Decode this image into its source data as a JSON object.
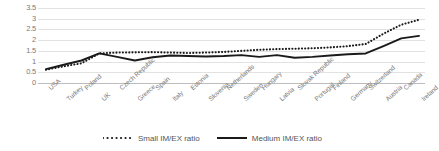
{
  "chart_data": {
    "type": "line",
    "title": "",
    "xlabel": "",
    "ylabel": "",
    "ylim": [
      0,
      3.5
    ],
    "ytick_labels": [
      "3.5",
      "3",
      "2.5",
      "2",
      "1.5",
      "1",
      "0.5",
      "0"
    ],
    "ytick_values": [
      3.5,
      3,
      2.5,
      2,
      1.5,
      1,
      0.5,
      0
    ],
    "grid": true,
    "legend_position": "bottom",
    "categories": [
      "USA",
      "Turkey",
      "Poland",
      "UK",
      "Czech Republic",
      "Greece",
      "Spain",
      "Italy",
      "Estonia",
      "Slovenia",
      "Netherlands",
      "Sweden",
      "Hungary",
      "Latvia",
      "Slovak Republic",
      "Portugal",
      "Finland",
      "Germany",
      "Switzerland",
      "Austria",
      "Canada",
      "Ireland"
    ],
    "series": [
      {
        "name": "Small IM/EX ratio",
        "style": "dotted",
        "color": "#1a1a1a",
        "values": [
          0.62,
          0.78,
          0.92,
          1.38,
          1.42,
          1.43,
          1.44,
          1.42,
          1.4,
          1.42,
          1.45,
          1.5,
          1.55,
          1.58,
          1.6,
          1.62,
          1.66,
          1.72,
          1.82,
          2.3,
          2.72,
          2.95
        ]
      },
      {
        "name": "Medium IM/EX ratio",
        "style": "solid",
        "color": "#1a1a1a",
        "values": [
          0.65,
          0.85,
          1.05,
          1.38,
          1.22,
          1.05,
          1.2,
          1.28,
          1.26,
          1.24,
          1.26,
          1.3,
          1.22,
          1.3,
          1.18,
          1.22,
          1.28,
          1.34,
          1.38,
          1.72,
          2.08,
          2.2
        ]
      }
    ]
  },
  "legend": {
    "items": [
      {
        "label": "Small IM/EX ratio",
        "marker": "dotted-line-swatch"
      },
      {
        "label": "Medium IM/EX ratio",
        "marker": "solid-line-swatch"
      }
    ]
  }
}
